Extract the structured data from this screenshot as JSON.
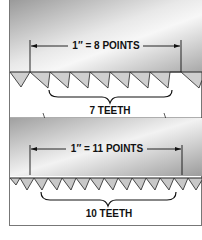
{
  "diagram": {
    "panels": [
      {
        "measure_label": "1″ = 8 POINTS",
        "teeth_label": "7 TEETH",
        "points": 8,
        "teeth": 7
      },
      {
        "measure_label": "1″ = 11 POINTS",
        "teeth_label": "10 TEETH",
        "points": 11,
        "teeth": 10
      }
    ]
  }
}
